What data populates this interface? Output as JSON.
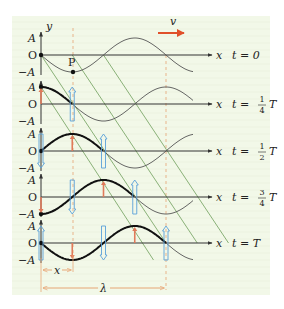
{
  "diagram": {
    "velocity_label": "v",
    "y_axis_label": "y",
    "x_axis_label": "x",
    "origin_label": "O",
    "amplitude_pos_label": "A",
    "amplitude_neg_label": "−A",
    "point_label": "P",
    "x_distance_label": "x",
    "wavelength_label": "λ",
    "colors": {
      "panel_bg": "#f2f8e8",
      "axis": "#333333",
      "wave_thin": "#555555",
      "wave_bold": "#111111",
      "guide_lines": "#6e9e5a",
      "dashed_guides": "#e8b48a",
      "velocity_arrow": "#e0502a",
      "displacement_up": "#e07a5a",
      "displacement_down": "#5aa0d8",
      "dimension_lines": "#e8a878"
    },
    "rows": [
      {
        "time_prefix": "t =",
        "time_value": "0",
        "fraction": null,
        "suffix": ""
      },
      {
        "time_prefix": "t =",
        "time_value": "",
        "fraction": {
          "num": "1",
          "den": "4"
        },
        "suffix": "T"
      },
      {
        "time_prefix": "t =",
        "time_value": "",
        "fraction": {
          "num": "1",
          "den": "2"
        },
        "suffix": "T"
      },
      {
        "time_prefix": "t =",
        "time_value": "",
        "fraction": {
          "num": "3",
          "den": "4"
        },
        "suffix": "T"
      },
      {
        "time_prefix": "t =",
        "time_value": "T",
        "fraction": null,
        "suffix": ""
      }
    ]
  }
}
